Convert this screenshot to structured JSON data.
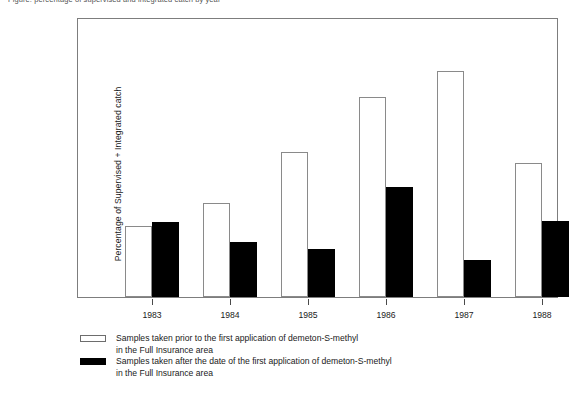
{
  "top_caption": "Figure: percentage of supervised and integrated catch by year",
  "chart_data": {
    "type": "bar",
    "title": "",
    "xlabel": "",
    "ylabel": "Percentage of Supervised + Integrated catch",
    "categories": [
      "1983",
      "1984",
      "1985",
      "1986",
      "1987",
      "1988"
    ],
    "ylim": [
      0,
      300
    ],
    "yticks_major": [
      0,
      50,
      100,
      150,
      200,
      250,
      300
    ],
    "yticks_minor": [
      25,
      75,
      125,
      175,
      225,
      275
    ],
    "ytick_labels": [
      "0",
      "50",
      "100",
      "150",
      "200",
      "250",
      "300"
    ],
    "grid": false,
    "legend_position": "below-plot",
    "series": [
      {
        "name": "Samples taken prior to the first application of demeton-S-methyl in the Full Insurance area",
        "legend_line1": "Samples taken prior to the first application of demeton-S-methyl",
        "legend_line2": "in the Full Insurance area",
        "style": "white-outlined",
        "color": "#ffffff",
        "edge_color": "#8a8a8a",
        "values": [
          76,
          101,
          155,
          215,
          243,
          144
        ]
      },
      {
        "name": "Samples taken after the date of the first application of demeton-S-methyl in the Full Insurance area",
        "legend_line1": "Samples taken after the date of the first application of demeton-S-methyl",
        "legend_line2": "in the Full Insurance area",
        "style": "solid-black",
        "color": "#000000",
        "edge_color": "#000000",
        "values": [
          80,
          59,
          51,
          118,
          39,
          81
        ]
      }
    ]
  }
}
